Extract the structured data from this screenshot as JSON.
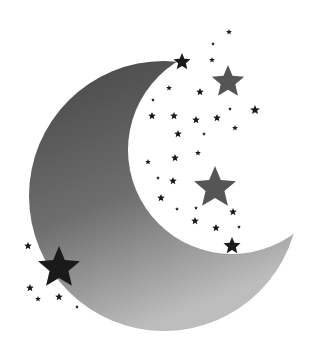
{
  "image": {
    "subject": "Crescent moon with stars",
    "background": "#ffffff",
    "moon": {
      "color_top": "#4a4a4a",
      "color_bottom": "#b5b5b5"
    },
    "star_color_dark": "#1a1a1a",
    "star_color_mid": "#555555",
    "stars": [
      {
        "x": 182,
        "y": 62,
        "r": 9,
        "tone": "dark"
      },
      {
        "x": 228,
        "y": 82,
        "r": 17,
        "tone": "mid"
      },
      {
        "x": 255,
        "y": 110,
        "r": 5,
        "tone": "dark"
      },
      {
        "x": 212,
        "y": 60,
        "r": 3,
        "tone": "dark"
      },
      {
        "x": 229,
        "y": 32,
        "r": 3,
        "tone": "dark"
      },
      {
        "x": 213,
        "y": 44,
        "r": 2,
        "tone": "dark"
      },
      {
        "x": 169,
        "y": 88,
        "r": 3,
        "tone": "dark"
      },
      {
        "x": 200,
        "y": 92,
        "r": 4,
        "tone": "dark"
      },
      {
        "x": 153,
        "y": 100,
        "r": 2,
        "tone": "dark"
      },
      {
        "x": 152,
        "y": 116,
        "r": 4,
        "tone": "dark"
      },
      {
        "x": 174,
        "y": 116,
        "r": 4,
        "tone": "dark"
      },
      {
        "x": 196,
        "y": 120,
        "r": 4,
        "tone": "dark"
      },
      {
        "x": 217,
        "y": 118,
        "r": 4,
        "tone": "dark"
      },
      {
        "x": 230,
        "y": 109,
        "r": 2,
        "tone": "dark"
      },
      {
        "x": 178,
        "y": 134,
        "r": 4,
        "tone": "dark"
      },
      {
        "x": 204,
        "y": 134,
        "r": 2,
        "tone": "dark"
      },
      {
        "x": 235,
        "y": 128,
        "r": 3,
        "tone": "dark"
      },
      {
        "x": 198,
        "y": 153,
        "r": 3,
        "tone": "dark"
      },
      {
        "x": 175,
        "y": 158,
        "r": 4,
        "tone": "dark"
      },
      {
        "x": 148,
        "y": 162,
        "r": 3,
        "tone": "dark"
      },
      {
        "x": 158,
        "y": 178,
        "r": 2,
        "tone": "dark"
      },
      {
        "x": 173,
        "y": 181,
        "r": 4,
        "tone": "dark"
      },
      {
        "x": 215,
        "y": 188,
        "r": 22,
        "tone": "mid"
      },
      {
        "x": 161,
        "y": 198,
        "r": 4,
        "tone": "dark"
      },
      {
        "x": 177,
        "y": 209,
        "r": 2,
        "tone": "dark"
      },
      {
        "x": 196,
        "y": 208,
        "r": 2,
        "tone": "dark"
      },
      {
        "x": 233,
        "y": 212,
        "r": 4,
        "tone": "dark"
      },
      {
        "x": 195,
        "y": 221,
        "r": 4,
        "tone": "dark"
      },
      {
        "x": 216,
        "y": 228,
        "r": 4,
        "tone": "dark"
      },
      {
        "x": 239,
        "y": 227,
        "r": 2,
        "tone": "dark"
      },
      {
        "x": 232,
        "y": 246,
        "r": 9,
        "tone": "dark"
      },
      {
        "x": 59,
        "y": 268,
        "r": 22,
        "tone": "dark"
      },
      {
        "x": 28,
        "y": 246,
        "r": 4,
        "tone": "dark"
      },
      {
        "x": 30,
        "y": 288,
        "r": 4,
        "tone": "dark"
      },
      {
        "x": 38,
        "y": 299,
        "r": 3,
        "tone": "dark"
      },
      {
        "x": 59,
        "y": 297,
        "r": 4,
        "tone": "dark"
      },
      {
        "x": 77,
        "y": 307,
        "r": 2,
        "tone": "dark"
      }
    ]
  }
}
